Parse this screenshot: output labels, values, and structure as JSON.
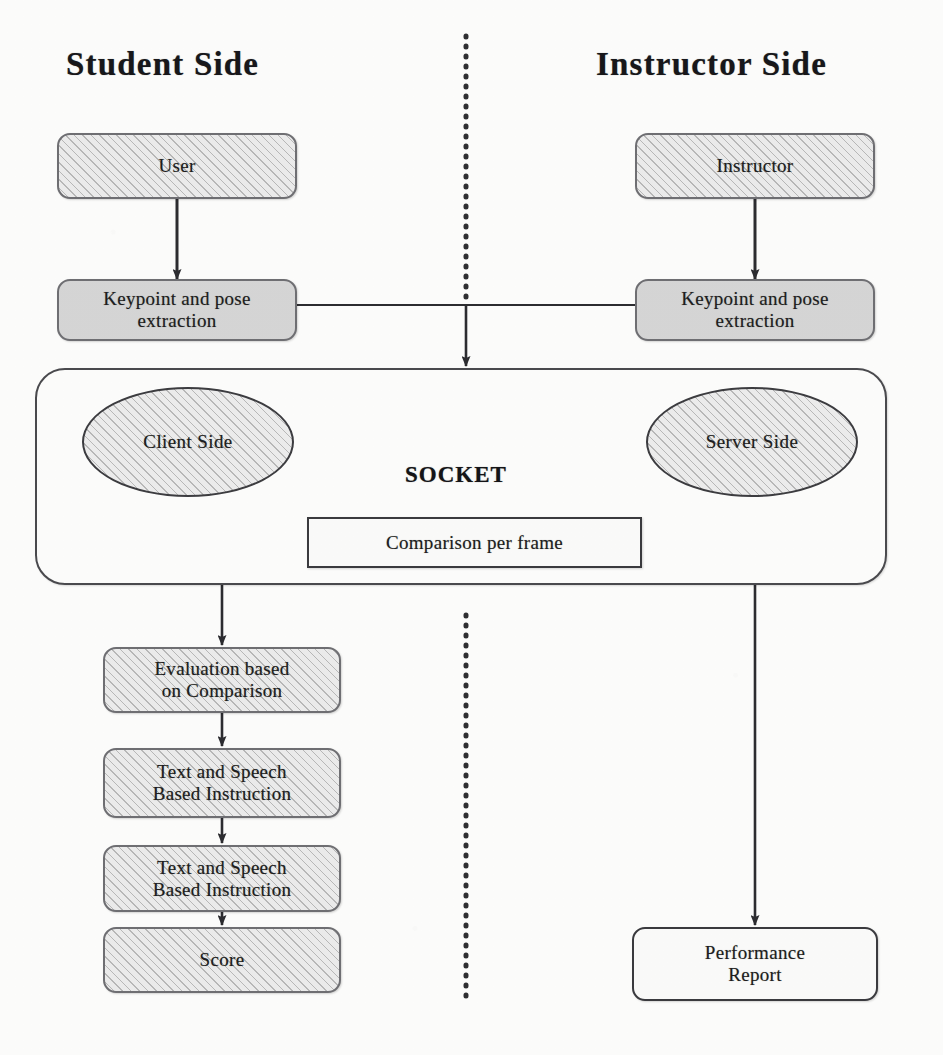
{
  "diagram": {
    "titles": {
      "left": "Student Side",
      "right": "Instructor Side"
    },
    "divider": {
      "style": "dotted-vertical",
      "color": "#2e2e31"
    },
    "socket_label": "SOCKET",
    "colors": {
      "stroke": "#4a4a4e",
      "node_border": "#6f6f73",
      "hatch_fill": "#ececec",
      "solid_gray_fill": "#d6d6d6",
      "white_fill": "#fbfbfa",
      "text": "#1d1d20",
      "background": "#fdfdfc"
    },
    "nodes": {
      "user": "User",
      "instructor": "Instructor",
      "keypoint_student": "Keypoint and pose extraction",
      "keypoint_student_l1": "Keypoint and pose",
      "keypoint_student_l2": "extraction",
      "keypoint_instructor_l1": "Keypoint and pose",
      "keypoint_instructor_l2": "extraction",
      "client_side": "Client Side",
      "server_side": "Server Side",
      "comparison_per_frame": "Comparison per frame",
      "evaluation_l1": "Evaluation based",
      "evaluation_l2": "on Comparison",
      "text_speech_1_l1": "Text and Speech",
      "text_speech_1_l2": "Based Instruction",
      "text_speech_2_l1": "Text and Speech",
      "text_speech_2_l2": "Based Instruction",
      "score": "Score",
      "performance_report_l1": "Performance",
      "performance_report_l2": "Report"
    },
    "edges": [
      {
        "from": "user",
        "to": "keypoint_student",
        "type": "arrow-down"
      },
      {
        "from": "instructor",
        "to": "keypoint_instructor",
        "type": "arrow-down"
      },
      {
        "from": "keypoint_student+keypoint_instructor",
        "to": "socket-container",
        "type": "join-arrow-down"
      },
      {
        "from": "server_side",
        "to": "client_side",
        "type": "double-arrow-horizontal"
      },
      {
        "from": "socket-container",
        "to": "evaluation",
        "type": "arrow-down"
      },
      {
        "from": "socket-container",
        "to": "performance_report",
        "type": "arrow-down"
      },
      {
        "from": "evaluation",
        "to": "text_speech_1",
        "type": "arrow-down"
      },
      {
        "from": "text_speech_1",
        "to": "text_speech_2",
        "type": "arrow-down"
      },
      {
        "from": "text_speech_2",
        "to": "score",
        "type": "arrow-down"
      }
    ]
  }
}
